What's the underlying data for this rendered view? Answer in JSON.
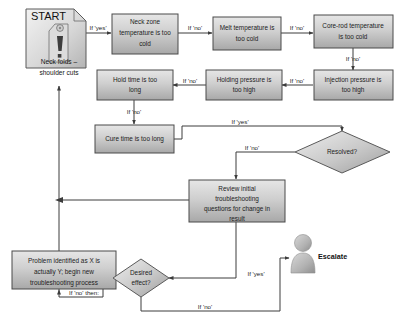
{
  "page": {
    "width": 397,
    "height": 324,
    "background": "#ffffff",
    "header_clipped_text": "​"
  },
  "colors": {
    "box_fill_light": "#e2e2e2",
    "box_fill_dark": "#a9a9a9",
    "box_border": "#4a4a4a",
    "line": "#3c3c3c",
    "text": "#1c1c1c",
    "person_fill": "#b0b0b0"
  },
  "diagram": {
    "type": "flowchart",
    "nodes": [
      {
        "id": "start",
        "shape": "document-folded",
        "label": "START",
        "icon": "warning-tag-icon"
      },
      {
        "id": "neck_folds",
        "shape": "plain-text",
        "label": "Neck folds – shoulder cuts"
      },
      {
        "id": "neck_zone",
        "shape": "process",
        "label": "Neck zone temperature is too cold"
      },
      {
        "id": "melt_temp",
        "shape": "process",
        "label": "Melt temperature is too cold"
      },
      {
        "id": "core_rod",
        "shape": "process",
        "label": "Core-rod temperature is too cold"
      },
      {
        "id": "hold_time",
        "shape": "process",
        "label": "Hold time is too long"
      },
      {
        "id": "holding_pressure",
        "shape": "process",
        "label": "Holding pressure is too high"
      },
      {
        "id": "injection_pressure",
        "shape": "process",
        "label": "Injection pressure is too high"
      },
      {
        "id": "cure_time",
        "shape": "process",
        "label": "Cure time is too long"
      },
      {
        "id": "resolved",
        "shape": "decision",
        "label": "Resolved?"
      },
      {
        "id": "review",
        "shape": "process",
        "label": "Review initial troubleshooting questions for change in result"
      },
      {
        "id": "problem",
        "shape": "process",
        "label": "Problem identified as X is actually Y; begin new troubleshooting process"
      },
      {
        "id": "desired",
        "shape": "decision",
        "label": "Desired effect?"
      },
      {
        "id": "escalate",
        "shape": "actor",
        "label": "Escalate",
        "icon": "person-icon"
      }
    ],
    "edges": [
      {
        "from": "start",
        "to": "neck_zone",
        "label": "If 'yes'"
      },
      {
        "from": "neck_zone",
        "to": "melt_temp",
        "label": "If 'no'"
      },
      {
        "from": "melt_temp",
        "to": "core_rod",
        "label": "If 'no'"
      },
      {
        "from": "core_rod",
        "to": "injection_pressure",
        "label": "If 'no'"
      },
      {
        "from": "injection_pressure",
        "to": "holding_pressure",
        "label": "If 'no'"
      },
      {
        "from": "holding_pressure",
        "to": "hold_time",
        "label": "If 'no'"
      },
      {
        "from": "hold_time",
        "to": "cure_time",
        "label": "If 'no'"
      },
      {
        "from": "cure_time",
        "to": "resolved",
        "label": "If 'yes'"
      },
      {
        "from": "resolved",
        "to": "review",
        "label": "If 'no'"
      },
      {
        "from": "review",
        "to": "neck_folds",
        "label": ""
      },
      {
        "from": "review",
        "to": "desired",
        "label": "If 'yes'"
      },
      {
        "from": "desired",
        "to": "escalate",
        "label": "If 'no'"
      },
      {
        "from": "desired",
        "to": "problem",
        "label": "If 'no' then:"
      }
    ],
    "edge_labels": {
      "start_yes": "If 'yes'",
      "neck_no": "If 'no'",
      "melt_no": "If 'no'",
      "core_no": "If 'no'",
      "inj_no": "If 'no'",
      "hold_no": "If 'no'",
      "hold_time_no": "If 'no'",
      "cure_yes": "If 'yes'",
      "resolved_no": "If 'no'",
      "desired_yes": "If 'yes'",
      "desired_no": "If 'no'",
      "desired_no_then": "If 'no' then:"
    },
    "node_labels": {
      "start": "START",
      "neck_folds_line1": "Neck folds –",
      "neck_folds_line2": "shoulder cuts",
      "neck_zone_line1": "Neck zone",
      "neck_zone_line2": "temperature is too",
      "neck_zone_line3": "cold",
      "melt_line1": "Melt temperature is",
      "melt_line2": "too cold",
      "core_line1": "Core-rod temperature",
      "core_line2": "is too cold",
      "hold_time_line1": "Hold time is too",
      "hold_time_line2": "long",
      "holding_pressure_line1": "Holding pressure is",
      "holding_pressure_line2": "too high",
      "injection_pressure_line1": "Injection pressure is",
      "injection_pressure_line2": "too high",
      "cure_time_line1": "Cure time is too long",
      "resolved": "Resolved?",
      "review_line1": "Review initial",
      "review_line2": "troubleshooting",
      "review_line3": "questions for change in",
      "review_line4": "result",
      "problem_line1": "Problem identified as X is",
      "problem_line2": "actually Y; begin new",
      "problem_line3": "troubleshooting process",
      "desired_line1": "Desired",
      "desired_line2": "effect?",
      "escalate": "Escalate"
    }
  }
}
